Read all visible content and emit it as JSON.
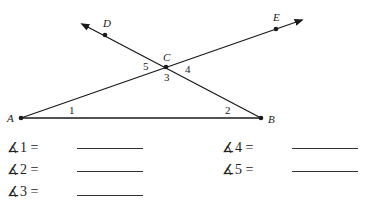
{
  "figure": {
    "points": {
      "A": {
        "label": "A",
        "x": 21,
        "y": 118
      },
      "B": {
        "label": "B",
        "x": 261,
        "y": 118
      },
      "C": {
        "label": "C",
        "x": 166,
        "y": 67
      },
      "D": {
        "label": "D",
        "x": 105,
        "y": 35
      },
      "E": {
        "label": "E",
        "x": 276,
        "y": 29
      }
    },
    "angle_labels": {
      "a1": "1",
      "a2": "2",
      "a3": "3",
      "a4": "4",
      "a5": "5"
    },
    "line_color": "#1a1a1a"
  },
  "answers": [
    {
      "label": "∡1 =",
      "value": ""
    },
    {
      "label": "∡2 =",
      "value": ""
    },
    {
      "label": "∡3 =",
      "value": ""
    },
    {
      "label": "∡4 =",
      "value": ""
    },
    {
      "label": "∡5 =",
      "value": ""
    }
  ]
}
